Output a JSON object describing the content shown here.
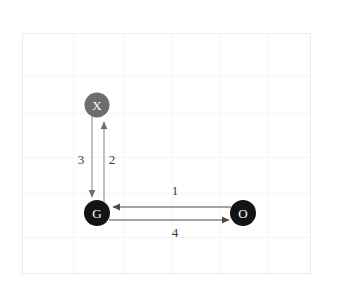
{
  "figure": {
    "title": "",
    "background_color": "#ffffff",
    "plot_area": {
      "x": 22,
      "y": 33,
      "width": 288,
      "height": 240,
      "frame_color": "#ececec",
      "grid_color": "#f2f2f2",
      "grid_visible": true,
      "grid_x": [
        22,
        73,
        123,
        172,
        220,
        268,
        310
      ],
      "grid_y": [
        33,
        75,
        113,
        157,
        193,
        237,
        273
      ]
    }
  },
  "diagram": {
    "type": "directed-graph",
    "nodes": [
      {
        "id": "X",
        "label": "X",
        "cx": 97,
        "cy": 105,
        "r": 12.5,
        "fill": "#6d6d6d",
        "text_color": "#ffffff"
      },
      {
        "id": "G",
        "label": "G",
        "cx": 97,
        "cy": 213,
        "r": 13,
        "fill": "#141414",
        "text_color": "#ffffff"
      },
      {
        "id": "O",
        "label": "O",
        "cx": 243,
        "cy": 213,
        "r": 13,
        "fill": "#141414",
        "text_color": "#ffffff"
      }
    ],
    "edges": [
      {
        "id": "edge-1",
        "label": "1",
        "from": "O",
        "to": "G",
        "direction": "leftward",
        "color": "#555555",
        "label_x": 175,
        "label_y": 192
      },
      {
        "id": "edge-2",
        "label": "2",
        "from": "G",
        "to": "X",
        "direction": "upward",
        "color": "#6f6f6f",
        "label_x": 112,
        "label_y": 161
      },
      {
        "id": "edge-3",
        "label": "3",
        "from": "X",
        "to": "G",
        "direction": "downward",
        "color": "#6f6f6f",
        "label_x": 81,
        "label_y": 161
      },
      {
        "id": "edge-4",
        "label": "4",
        "from": "G",
        "to": "O",
        "direction": "rightward",
        "color": "#555555",
        "label_x": 175,
        "label_y": 234
      }
    ]
  }
}
